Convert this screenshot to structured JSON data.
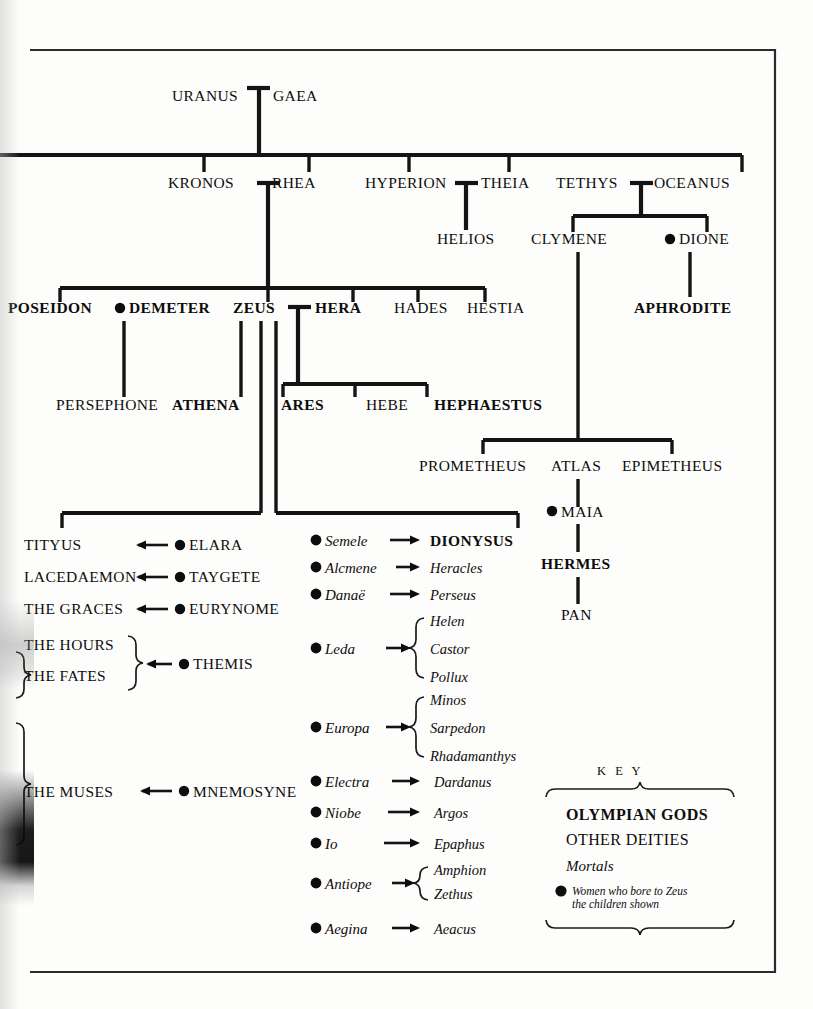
{
  "diagram": {
    "colors": {
      "ink": "#0d0d0d",
      "frame": "#2b2b2b",
      "paper": "#fdfdfc"
    }
  },
  "generation_1": {
    "uranus": "URANUS",
    "gaea": "GAEA"
  },
  "generation_2": {
    "kronos": "KRONOS",
    "rhea": "RHEA",
    "hyperion": "HYPERION",
    "theia": "THEIA",
    "tethys": "TETHYS",
    "oceanus": "OCEANUS"
  },
  "generation_3": {
    "helios": "HELIOS",
    "clymene": "CLYMENE",
    "dione": "DIONE"
  },
  "olympian_row": {
    "poseidon": "POSEIDON",
    "demeter": "DEMETER",
    "zeus": "ZEUS",
    "hera": "HERA",
    "hades": "HADES",
    "hestia": "HESTIA",
    "aphrodite": "APHRODITE"
  },
  "children_row": {
    "persephone": "PERSEPHONE",
    "athena": "ATHENA",
    "ares": "ARES",
    "hebe": "HEBE",
    "hephaestus": "HEPHAESTUS"
  },
  "titans_row": {
    "prometheus": "PROMETHEUS",
    "atlas": "ATLAS",
    "epimetheus": "EPIMETHEUS"
  },
  "hermes_line": {
    "maia": "MAIA",
    "hermes": "HERMES",
    "pan": "PAN"
  },
  "left_consorts": [
    {
      "child": "TITYUS",
      "consort": "ELARA",
      "style": "caps"
    },
    {
      "child": "LACEDAEMON",
      "consort": "TAYGETE",
      "style": "caps"
    },
    {
      "child": "THE  GRACES",
      "consort": "EURYNOME",
      "style": "caps"
    },
    {
      "child": "THE  HOURS",
      "consort": "THEMIS",
      "style": "caps"
    },
    {
      "child": "THE  FATES",
      "consort": "THEMIS",
      "style": "caps"
    },
    {
      "child": "THE  MUSES",
      "consort": "MNEMOSYNE",
      "style": "caps"
    }
  ],
  "right_consorts": [
    {
      "mother": "Semele",
      "children": [
        "DIONYSUS"
      ]
    },
    {
      "mother": "Alcmene",
      "children": [
        "Heracles"
      ]
    },
    {
      "mother": "Danaë",
      "children": [
        "Perseus"
      ]
    },
    {
      "mother": "Leda",
      "children": [
        "Helen",
        "Castor",
        "Pollux"
      ]
    },
    {
      "mother": "Europa",
      "children": [
        "Minos",
        "Sarpedon",
        "Rhadamanthys"
      ]
    },
    {
      "mother": "Electra",
      "children": [
        "Dardanus"
      ]
    },
    {
      "mother": "Niobe",
      "children": [
        "Argos"
      ]
    },
    {
      "mother": "Io",
      "children": [
        "Epaphus"
      ]
    },
    {
      "mother": "Antiope",
      "children": [
        "Amphion",
        "Zethus"
      ]
    },
    {
      "mother": "Aegina",
      "children": [
        "Aeacus"
      ]
    }
  ],
  "key": {
    "title": "K E Y",
    "olympian": "OLYMPIAN GODS",
    "other": "OTHER DEITIES",
    "mortals": "Mortals",
    "women_line1": "Women who bore to Zeus",
    "women_line2": "the children shown"
  }
}
